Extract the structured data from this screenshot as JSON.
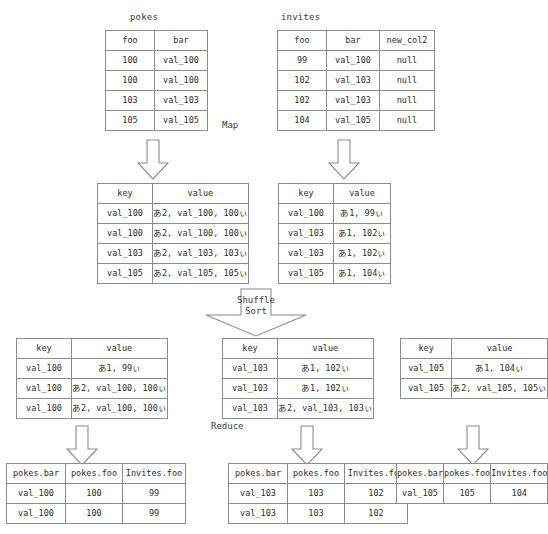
{
  "diagram": {
    "title_pokes": "pokes",
    "title_invites": "invites",
    "stage_map": "Map",
    "stage_shuffle_line1": "Shuffle",
    "stage_shuffle_line2": "Sort",
    "stage_reduce": "Reduce"
  },
  "source_tables": [
    {
      "name": "pokes",
      "headers": [
        "foo",
        "bar"
      ],
      "rows": [
        [
          "100",
          "val_100"
        ],
        [
          "100",
          "val_100"
        ],
        [
          "103",
          "val_103"
        ],
        [
          "105",
          "val_105"
        ]
      ]
    },
    {
      "name": "invites",
      "headers": [
        "foo",
        "bar",
        "new_col2"
      ],
      "rows": [
        [
          "99",
          "val_100",
          "null"
        ],
        [
          "102",
          "val_103",
          "null"
        ],
        [
          "102",
          "val_103",
          "null"
        ],
        [
          "104",
          "val_105",
          "null"
        ]
      ]
    }
  ],
  "map_outputs": [
    {
      "headers": [
        "key",
        "value"
      ],
      "rows": [
        [
          "val_100",
          "あ2, val_100, 100ぃ"
        ],
        [
          "val_100",
          "あ2, val_100, 100ぃ"
        ],
        [
          "val_103",
          "あ2, val_103, 103ぃ"
        ],
        [
          "val_105",
          "あ2, val_105, 105ぃ"
        ]
      ]
    },
    {
      "headers": [
        "key",
        "value"
      ],
      "rows": [
        [
          "val_100",
          "あ1, 99ぃ"
        ],
        [
          "val_103",
          "あ1, 102ぃ"
        ],
        [
          "val_103",
          "あ1, 102ぃ"
        ],
        [
          "val_105",
          "あ1, 104ぃ"
        ]
      ]
    }
  ],
  "shuffle_outputs": [
    {
      "headers": [
        "key",
        "value"
      ],
      "rows": [
        [
          "val_100",
          "あ1, 99ぃ"
        ],
        [
          "val_100",
          "あ2, val_100, 100ぃ"
        ],
        [
          "val_100",
          "あ2, val_100, 100ぃ"
        ]
      ]
    },
    {
      "headers": [
        "key",
        "value"
      ],
      "rows": [
        [
          "val_103",
          "あ1, 102ぃ"
        ],
        [
          "val_103",
          "あ1, 102ぃ"
        ],
        [
          "val_103",
          "あ2, val_103, 103ぃ"
        ]
      ]
    },
    {
      "headers": [
        "key",
        "value"
      ],
      "rows": [
        [
          "val_105",
          "あ1, 104ぃ"
        ],
        [
          "val_105",
          "あ2, val_105, 105ぃ"
        ]
      ]
    }
  ],
  "reduce_outputs": [
    {
      "headers": [
        "pokes.bar",
        "pokes.foo",
        "Invites.foo"
      ],
      "rows": [
        [
          "val_100",
          "100",
          "99"
        ],
        [
          "val_100",
          "100",
          "99"
        ]
      ]
    },
    {
      "headers": [
        "pokes.bar",
        "pokes.foo",
        "Invites.foo"
      ],
      "rows": [
        [
          "val_103",
          "103",
          "102"
        ],
        [
          "val_103",
          "103",
          "102"
        ]
      ]
    },
    {
      "headers": [
        "pokes.bar",
        "pokes.foo",
        "Invites.foo"
      ],
      "rows": [
        [
          "val_105",
          "105",
          "104"
        ]
      ]
    }
  ],
  "colors": {
    "border": "#8c8c8c",
    "text": "#2b2b2b",
    "background": "#ffffff"
  }
}
